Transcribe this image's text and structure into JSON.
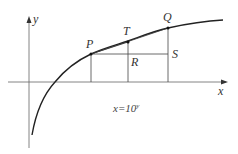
{
  "diagram": {
    "axes": {
      "x_label": "x",
      "y_label": "y"
    },
    "points": {
      "P": "P",
      "T": "T",
      "Q": "Q",
      "R": "R",
      "S": "S"
    },
    "equation": {
      "lhs": "x=10",
      "exp": "y"
    },
    "colors": {
      "curve": "#222222",
      "axis": "#555555",
      "lines": "#333333"
    }
  }
}
